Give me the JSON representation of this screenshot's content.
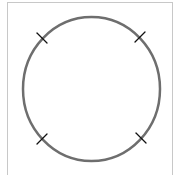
{
  "diagram": {
    "type": "circle-with-tick-marks",
    "frame_color": "#c8c8c8",
    "circle": {
      "cx": 91.5,
      "cy": 89,
      "rx": 68.5,
      "ry": 72,
      "stroke": "#6e6e6e",
      "stroke_width": 2.5
    },
    "tick_color": "#111111",
    "ticks": [
      {
        "position": "top-left",
        "x": 42,
        "y": 38,
        "angle": 135
      },
      {
        "position": "top-right",
        "x": 140,
        "y": 37,
        "angle": 45
      },
      {
        "position": "bottom-left",
        "x": 42,
        "y": 139,
        "angle": 45
      },
      {
        "position": "bottom-right",
        "x": 141,
        "y": 138,
        "angle": 135
      }
    ]
  }
}
